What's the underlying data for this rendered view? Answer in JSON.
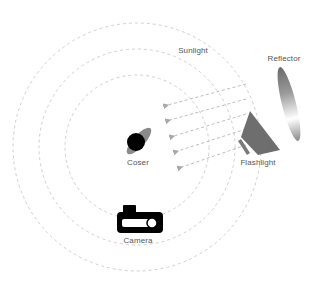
{
  "diagram": {
    "type": "lighting-setup",
    "labels": {
      "sunlight": "Sunlight",
      "reflector": "Reflector",
      "coser": "Coser",
      "flashlight": "Flashlight",
      "camera": "Camera"
    },
    "colors": {
      "circle": "#d0d0d0",
      "arrow": "#bdbdbd",
      "subject_body": "#8a8a8a",
      "subject_head": "#000000",
      "flashlight": "#6e6e6e",
      "reflector_dark": "#6a6a6a",
      "camera": "#000000",
      "text": "#555555"
    },
    "rings": [
      {
        "name": "inner",
        "cx": 137,
        "cy": 147,
        "r": 72
      },
      {
        "name": "middle",
        "cx": 137,
        "cy": 147,
        "r": 98
      },
      {
        "name": "outer",
        "cx": 137,
        "cy": 147,
        "r": 124
      }
    ],
    "light_rays": [
      {
        "x1": 246,
        "y1": 84,
        "x2": 164,
        "y2": 106
      },
      {
        "x1": 246,
        "y1": 99,
        "x2": 166,
        "y2": 121
      },
      {
        "x1": 246,
        "y1": 114,
        "x2": 170,
        "y2": 137
      },
      {
        "x1": 246,
        "y1": 129,
        "x2": 174,
        "y2": 152
      },
      {
        "x1": 246,
        "y1": 145,
        "x2": 178,
        "y2": 168
      }
    ]
  }
}
